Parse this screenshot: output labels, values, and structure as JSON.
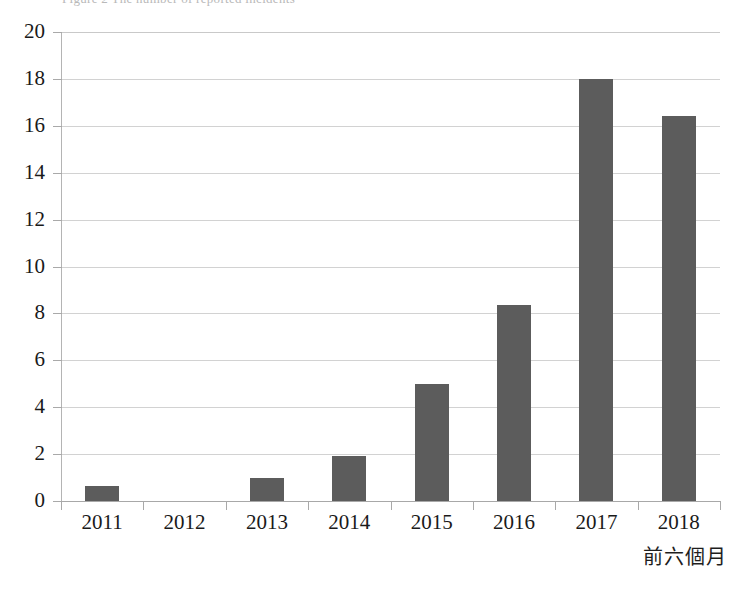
{
  "chart_data": {
    "type": "bar",
    "title": "",
    "xlabel": "",
    "ylabel": "",
    "categories": [
      "2011",
      "2012",
      "2013",
      "2014",
      "2015",
      "2016",
      "2017",
      "2018"
    ],
    "values": [
      0.65,
      0,
      1.0,
      1.9,
      5.0,
      8.35,
      18.0,
      16.4
    ],
    "ylim": [
      0,
      20
    ],
    "ytick_values": [
      0,
      2,
      4,
      6,
      8,
      10,
      12,
      14,
      16,
      18,
      20
    ],
    "ytick_labels": [
      "0",
      "2",
      "4",
      "6",
      "8",
      "10",
      "12",
      "14",
      "16",
      "18",
      "20"
    ],
    "grid": true,
    "legend": false,
    "bar_color": "#5c5c5c",
    "grid_color": "#d2d2d2",
    "axis_color": "#b4b4b4",
    "annotations": [
      {
        "text": "前六個月",
        "position": "bottom-right"
      }
    ]
  },
  "footnote": {
    "text": "前六個月"
  },
  "title_strip": {
    "ghost_text": "Figure 2  The number of reported incidents"
  }
}
